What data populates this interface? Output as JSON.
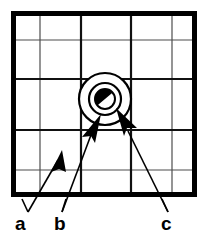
{
  "figure": {
    "background_color": "#ffffff",
    "ink_color": "#000000",
    "grid_line_color": "#4d4d4d",
    "canvas": {
      "width": 209,
      "height": 237
    }
  },
  "frame": {
    "name": "outer-border",
    "x": 11,
    "y": 11,
    "width": 186,
    "height": 186,
    "stroke_width": 5,
    "color": "#000000"
  },
  "grid": {
    "vertical_lines": [
      40,
      81,
      131,
      172
    ],
    "horizontal_lines": [
      40,
      79,
      130,
      170
    ],
    "thin_stroke_width": 1.2,
    "thick_stroke_width": 2.2,
    "thick_vertical_lines": [
      81,
      131
    ],
    "thick_horizontal_lines": [
      79,
      130
    ]
  },
  "center_feature": {
    "name": "ring-with-core",
    "ring": {
      "center_x": 105,
      "center_y": 99,
      "outer_radius": 26,
      "inner_radius": 16,
      "stroke_width": 2.2,
      "color": "#000000",
      "fill": "#ffffff"
    },
    "core": {
      "center_x": 105,
      "center_y": 99,
      "radius": 10,
      "stroke_width": 2,
      "fill_half": "#000000",
      "fill_half_empty": "#ffffff",
      "split_angle_degrees": 40
    }
  },
  "annotations": [
    {
      "id": "a",
      "label": "a",
      "label_x": 15,
      "label_y": 229,
      "line": {
        "x1": 28,
        "y1": 212,
        "x2": 57,
        "y2": 162
      },
      "arrow_tip_x": 60,
      "arrow_tip_y": 155,
      "arrow_angle_degrees": -60,
      "arrow_length": 22,
      "arrow_half_width": 6,
      "color": "#000000"
    },
    {
      "id": "b",
      "label": "b",
      "label_x": 53,
      "label_y": 229,
      "line": {
        "x1": 62,
        "y1": 212,
        "x2": 90,
        "y2": 137
      },
      "arrow_tip_x": 99,
      "arrow_tip_y": 116,
      "arrow_angle_degrees": -68,
      "arrow_length": 24,
      "arrow_half_width": 6.5,
      "color": "#000000"
    },
    {
      "id": "c",
      "label": "c",
      "label_x": 161,
      "label_y": 229,
      "line": {
        "x1": 168,
        "y1": 212,
        "x2": 127,
        "y2": 130
      },
      "arrow_tip_x": 115,
      "arrow_tip_y": 110,
      "arrow_angle_degrees": -120,
      "arrow_length": 24,
      "arrow_half_width": 6.5,
      "color": "#000000"
    }
  ]
}
